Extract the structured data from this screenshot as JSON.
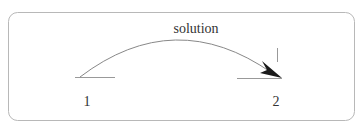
{
  "diagram": {
    "header_text_cut_off": true,
    "arrow_label": "solution",
    "nodes": [
      {
        "id": "1",
        "label": "1"
      },
      {
        "id": "2",
        "label": "2"
      }
    ],
    "edges": [
      {
        "from": "1",
        "to": "2",
        "label": "solution"
      }
    ],
    "colors": {
      "frame": "#b8b8b8",
      "line": "#888888",
      "arrowhead": "#1a1a1a",
      "text": "#333333"
    }
  }
}
